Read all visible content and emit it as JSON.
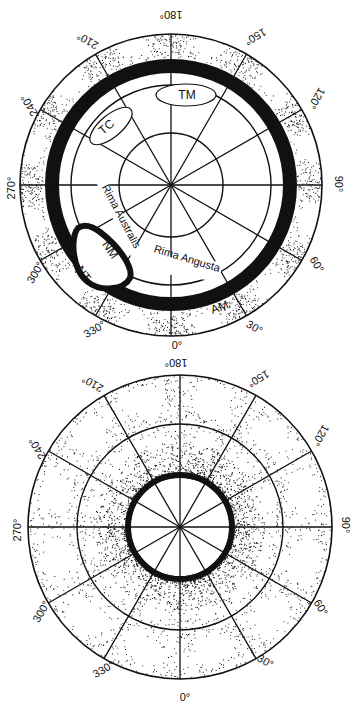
{
  "figure": {
    "width": 355,
    "height": 708,
    "ink_color": "#111111",
    "background": "#ffffff"
  },
  "angle_tick_labels": [
    "0°",
    "30°",
    "60°",
    "90°",
    "120°",
    "150°",
    "180°",
    "210°",
    "240°",
    "270°",
    "300°",
    "330°"
  ],
  "panels": [
    {
      "id": "top-polar-map",
      "center": [
        171,
        185
      ],
      "outer_radius": 151,
      "ring_radii": [
        52,
        100,
        151
      ],
      "radial_spokes_inner_deg": [
        0,
        30,
        60,
        90,
        120,
        150,
        180,
        210,
        240,
        270,
        300,
        330
      ],
      "radial_spokes_outer_deg": [
        0,
        30,
        60,
        90,
        120,
        150,
        180,
        210,
        240,
        270,
        300,
        330
      ],
      "orientation": "180° at top, 0° at bottom, 90° right, 270° left",
      "angle_labels": [
        {
          "text": "180°",
          "x": 171,
          "y": 14,
          "rot": 180
        },
        {
          "text": "150°",
          "x": 255,
          "y": 36,
          "rot": 150
        },
        {
          "text": "120°",
          "x": 316,
          "y": 98,
          "rot": 120
        },
        {
          "text": "90°",
          "x": 338,
          "y": 184,
          "rot": 90
        },
        {
          "text": "60°",
          "x": 316,
          "y": 265,
          "rot": 60
        },
        {
          "text": "30°",
          "x": 254,
          "y": 328,
          "rot": 30
        },
        {
          "text": "0°",
          "x": 177,
          "y": 346,
          "rot": 0
        },
        {
          "text": "330°",
          "x": 95,
          "y": 330,
          "rot": -30
        },
        {
          "text": "300°",
          "x": 36,
          "y": 273,
          "rot": -60
        },
        {
          "text": "270°",
          "x": 12,
          "y": 188,
          "rot": -90
        },
        {
          "text": "240°",
          "x": 30,
          "y": 105,
          "rot": -120
        },
        {
          "text": "210°",
          "x": 88,
          "y": 40,
          "rot": -150
        }
      ],
      "dark_ring": {
        "r_inner": 112,
        "r_outer": 126,
        "note": "thick black band (ring depression)"
      },
      "feature_labels": [
        {
          "text": "TM",
          "x": 187,
          "y": 99,
          "rot": 0,
          "boxed": true,
          "box": {
            "cx": 186,
            "cy": 95,
            "rx": 30,
            "ry": 11
          }
        },
        {
          "text": "TC",
          "x": 109,
          "y": 130,
          "rot": -40,
          "boxed": true,
          "box": {
            "cx": 111,
            "cy": 126,
            "rx": 26,
            "ry": 11,
            "rot": -40
          }
        },
        {
          "text": "Rima Australis",
          "x": 118,
          "y": 218,
          "rot": 62,
          "boxed": false
        },
        {
          "text": "NM",
          "x": 107,
          "y": 252,
          "rot": 55,
          "boxed": false
        },
        {
          "text": "NT",
          "x": 80,
          "y": 276,
          "rot": 55,
          "boxed": false
        },
        {
          "text": "Rima Angusta",
          "x": 186,
          "y": 262,
          "rot": 17,
          "boxed": false
        },
        {
          "text": "AM",
          "x": 221,
          "y": 311,
          "rot": -20,
          "boxed": false
        }
      ]
    },
    {
      "id": "bottom-polar-map",
      "center": [
        180,
        527
      ],
      "outer_radius": 152,
      "ring_radii": [
        50,
        103,
        152
      ],
      "radial_spokes_inner_deg": [
        0,
        30,
        60,
        90,
        120,
        150,
        180,
        210,
        240,
        270,
        300,
        330
      ],
      "radial_spokes_outer_deg": [
        0,
        30,
        60,
        90,
        120,
        150,
        180,
        210,
        240,
        270,
        300,
        330
      ],
      "orientation": "180° at top, 0° at bottom, 90° right, 270° left",
      "angle_labels": [
        {
          "text": "180°",
          "x": 176,
          "y": 362,
          "rot": 180
        },
        {
          "text": "150°",
          "x": 258,
          "y": 378,
          "rot": 150
        },
        {
          "text": "120°",
          "x": 320,
          "y": 435,
          "rot": 120
        },
        {
          "text": "90°",
          "x": 345,
          "y": 525,
          "rot": 90
        },
        {
          "text": "60°",
          "x": 320,
          "y": 608,
          "rot": 60
        },
        {
          "text": "30°",
          "x": 265,
          "y": 662,
          "rot": 30
        },
        {
          "text": "0°",
          "x": 185,
          "y": 698,
          "rot": 0
        },
        {
          "text": "330°",
          "x": 104,
          "y": 670,
          "rot": -30
        },
        {
          "text": "300°",
          "x": 42,
          "y": 612,
          "rot": -60
        },
        {
          "text": "270°",
          "x": 18,
          "y": 530,
          "rot": -90
        },
        {
          "text": "240°",
          "x": 38,
          "y": 448,
          "rot": -120
        },
        {
          "text": "210°",
          "x": 93,
          "y": 383,
          "rot": -150
        }
      ],
      "dark_ring": {
        "r_inner": 49,
        "r_outer": 55,
        "note": "thin black rim around central depression"
      },
      "feature_labels": []
    }
  ]
}
